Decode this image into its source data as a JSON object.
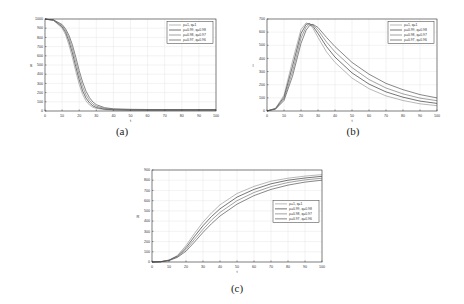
{
  "figures": [
    {
      "id": "a",
      "caption": "(a)"
    },
    {
      "id": "b",
      "caption": "(b)"
    },
    {
      "id": "c",
      "caption": "(c)"
    }
  ],
  "chart_data": [
    {
      "type": "line",
      "panel": "(a)",
      "title": "",
      "xlabel": "t",
      "ylabel": "S",
      "xlim": [
        0,
        100
      ],
      "ylim": [
        0,
        1000
      ],
      "xticks": [
        0,
        10,
        20,
        30,
        40,
        50,
        60,
        70,
        80,
        90,
        100
      ],
      "yticks": [
        0,
        100,
        200,
        300,
        400,
        500,
        600,
        700,
        800,
        900,
        1000
      ],
      "grid": true,
      "legend_position": "upper right",
      "x": [
        0,
        5,
        10,
        12,
        14,
        16,
        18,
        20,
        22,
        24,
        26,
        28,
        30,
        35,
        40,
        50,
        60,
        70,
        80,
        90,
        100
      ],
      "series": [
        {
          "name": "ρ=1, q=1",
          "values": [
            999,
            985,
            900,
            830,
            720,
            580,
            430,
            290,
            180,
            110,
            65,
            40,
            28,
            15,
            10,
            8,
            8,
            8,
            8,
            8,
            8
          ]
        },
        {
          "name": "ρ=0.99, q=0.98",
          "values": [
            999,
            987,
            915,
            855,
            760,
            630,
            480,
            340,
            220,
            140,
            88,
            55,
            38,
            20,
            14,
            11,
            10,
            10,
            10,
            10,
            10
          ]
        },
        {
          "name": "ρ=0.98, q=0.97",
          "values": [
            999,
            989,
            928,
            875,
            795,
            675,
            530,
            390,
            265,
            175,
            115,
            75,
            52,
            27,
            18,
            14,
            13,
            13,
            13,
            13,
            13
          ]
        },
        {
          "name": "ρ=0.97, q=0.96",
          "values": [
            999,
            990,
            940,
            895,
            825,
            720,
            585,
            440,
            315,
            215,
            145,
            98,
            68,
            36,
            24,
            18,
            16,
            16,
            16,
            16,
            16
          ]
        }
      ]
    },
    {
      "type": "line",
      "panel": "(b)",
      "title": "",
      "xlabel": "t",
      "ylabel": "I",
      "xlim": [
        0,
        100
      ],
      "ylim": [
        0,
        700
      ],
      "xticks": [
        0,
        10,
        20,
        30,
        40,
        50,
        60,
        70,
        80,
        90,
        100
      ],
      "yticks": [
        0,
        100,
        200,
        300,
        400,
        500,
        600,
        700
      ],
      "grid": true,
      "legend_position": "upper right",
      "x": [
        0,
        5,
        10,
        15,
        20,
        23,
        25,
        27,
        30,
        35,
        40,
        50,
        60,
        70,
        80,
        90,
        100
      ],
      "series": [
        {
          "name": "ρ=1, q=1",
          "values": [
            1,
            20,
            120,
            380,
            620,
            670,
            660,
            630,
            560,
            450,
            370,
            250,
            170,
            115,
            80,
            55,
            40
          ]
        },
        {
          "name": "ρ=0.99, q=0.98",
          "values": [
            1,
            18,
            105,
            340,
            590,
            660,
            665,
            645,
            590,
            490,
            410,
            290,
            205,
            145,
            105,
            75,
            58
          ]
        },
        {
          "name": "ρ=0.98, q=0.97",
          "values": [
            1,
            16,
            92,
            300,
            555,
            640,
            662,
            655,
            615,
            525,
            450,
            330,
            240,
            175,
            130,
            98,
            78
          ]
        },
        {
          "name": "ρ=0.97, q=0.96",
          "values": [
            1,
            14,
            80,
            265,
            515,
            615,
            650,
            660,
            635,
            560,
            490,
            370,
            280,
            210,
            162,
            125,
            100
          ]
        }
      ]
    },
    {
      "type": "line",
      "panel": "(c)",
      "title": "",
      "xlabel": "t",
      "ylabel": "R",
      "xlim": [
        0,
        100
      ],
      "ylim": [
        0,
        900
      ],
      "xticks": [
        0,
        10,
        20,
        30,
        40,
        50,
        60,
        70,
        80,
        90,
        100
      ],
      "yticks": [
        0,
        100,
        200,
        300,
        400,
        500,
        600,
        700,
        800,
        900
      ],
      "grid": true,
      "legend_position": "center right",
      "x": [
        0,
        5,
        10,
        15,
        20,
        25,
        30,
        35,
        40,
        50,
        60,
        70,
        80,
        90,
        100
      ],
      "series": [
        {
          "name": "ρ=1, q=1",
          "values": [
            0,
            3,
            20,
            65,
            160,
            280,
            390,
            480,
            560,
            670,
            740,
            790,
            820,
            840,
            855
          ]
        },
        {
          "name": "ρ=0.99, q=0.98",
          "values": [
            0,
            3,
            18,
            58,
            140,
            250,
            355,
            445,
            520,
            635,
            710,
            765,
            800,
            822,
            838
          ]
        },
        {
          "name": "ρ=0.98, q=0.97",
          "values": [
            0,
            2,
            16,
            52,
            122,
            222,
            320,
            410,
            485,
            600,
            680,
            738,
            778,
            803,
            820
          ]
        },
        {
          "name": "ρ=0.97, q=0.96",
          "values": [
            0,
            2,
            14,
            46,
            106,
            196,
            290,
            375,
            450,
            565,
            650,
            710,
            752,
            782,
            800
          ]
        }
      ]
    }
  ]
}
